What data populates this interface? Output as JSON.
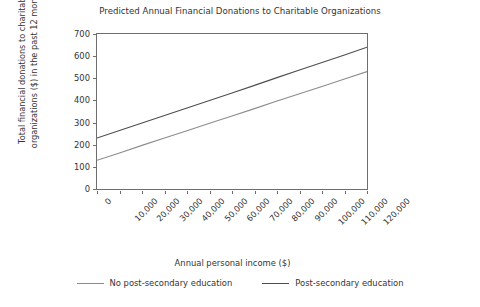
{
  "chart_data": {
    "type": "line",
    "title": "Predicted Annual Financial Donations to Charitable Organizations",
    "xlabel": "Annual personal income ($)",
    "ylabel_line1": "Total financial donations to charitable",
    "ylabel_line2": "organizations ($) in the past 12 months",
    "x": [
      0,
      10000,
      20000,
      30000,
      40000,
      50000,
      60000,
      70000,
      80000,
      90000,
      100000,
      110000,
      120000
    ],
    "xtick_labels": [
      "0",
      "10,000",
      "20,000",
      "30,000",
      "40,000",
      "50,000",
      "60,000",
      "70,000",
      "80,000",
      "90,000",
      "100,000",
      "110,000",
      "120,000"
    ],
    "ytick_labels": [
      "0",
      "100",
      "200",
      "300",
      "400",
      "500",
      "600",
      "700"
    ],
    "yticks": [
      0,
      100,
      200,
      300,
      400,
      500,
      600,
      700
    ],
    "xlim": [
      0,
      120000
    ],
    "ylim": [
      0,
      700
    ],
    "grid": false,
    "legend_position": "below",
    "series": [
      {
        "name": "No post-secondary education",
        "color": "#8c8c8c",
        "values": [
          130,
          163,
          197,
          230,
          263,
          297,
          330,
          363,
          397,
          430,
          463,
          497,
          530
        ]
      },
      {
        "name": "Post-secondary education",
        "color": "#4d4d4d",
        "values": [
          230,
          264,
          298,
          332,
          366,
          400,
          434,
          468,
          503,
          537,
          571,
          605,
          640
        ]
      }
    ]
  },
  "axis": {
    "frame_color": "#6e6e6e"
  }
}
